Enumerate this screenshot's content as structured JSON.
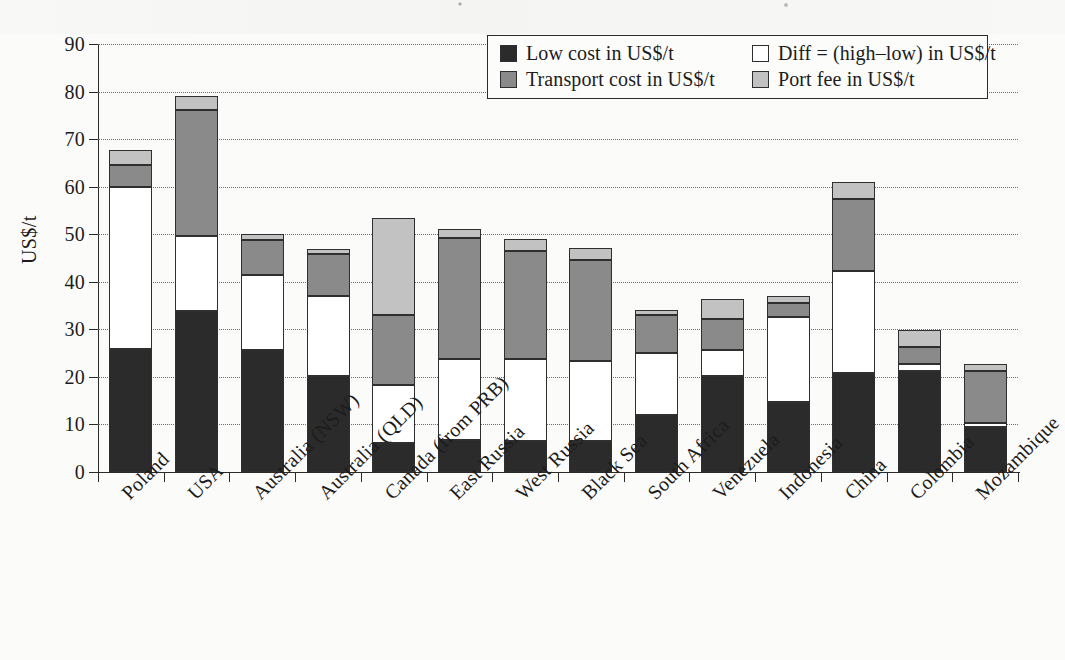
{
  "chart_data": {
    "type": "bar",
    "subtype": "stacked-vertical",
    "title": "",
    "xlabel": "",
    "ylabel": "US$/t",
    "ylim": [
      0,
      90
    ],
    "ytick_step": 10,
    "yticks": [
      0,
      10,
      20,
      30,
      40,
      50,
      60,
      70,
      80,
      90
    ],
    "ytick_labels": [
      "0",
      "10",
      "20",
      "30",
      "40",
      "50",
      "60",
      "70",
      "80",
      "90"
    ],
    "grid": "horizontal-dotted",
    "xtick_label_rotation": -45,
    "legend_position": "top-right-inside",
    "legend_columns": 2,
    "categories": [
      "Poland",
      "USA",
      "Australia (NSW)",
      "Australia (QLD)",
      "Canada (from PRB)",
      "East Russia",
      "West Russia",
      "Black Sea",
      "South Africa",
      "Venezuela",
      "Indonesia",
      "China",
      "Colombia",
      "Mozambique"
    ],
    "series": [
      {
        "name": "Low cost in US$/t",
        "color": "#2b2b2b",
        "values": [
          25.8,
          33.8,
          25.6,
          20.2,
          6.0,
          6.7,
          6.6,
          6.5,
          11.9,
          20.2,
          14.7,
          20.8,
          21.2,
          9.5
        ]
      },
      {
        "name": "Diff = (high–low) in US$/t",
        "color": "#ffffff",
        "values": [
          34.2,
          15.9,
          15.9,
          16.8,
          12.2,
          17.1,
          17.2,
          16.8,
          13.1,
          5.5,
          17.8,
          21.5,
          1.6,
          0.8
        ]
      },
      {
        "name": "Transport cost in US$/t",
        "color": "#8a8a8a",
        "values": [
          4.5,
          26.5,
          7.2,
          8.8,
          14.8,
          25.5,
          22.6,
          21.3,
          8.0,
          6.5,
          3.0,
          15.2,
          3.5,
          11.0
        ]
      },
      {
        "name": "Port fee in US$/t",
        "color": "#c2c2c2",
        "values": [
          3.3,
          2.8,
          1.3,
          1.2,
          20.5,
          1.7,
          2.6,
          2.6,
          1.0,
          4.1,
          1.5,
          3.5,
          3.5,
          1.4
        ]
      }
    ],
    "totals": [
      67.8,
      79.0,
      50.0,
      47.0,
      53.5,
      51.0,
      49.0,
      47.2,
      34.0,
      36.3,
      37.0,
      61.0,
      29.8,
      22.7
    ]
  },
  "legend": {
    "entries": [
      {
        "label": "Low cost in US$/t",
        "color": "#2b2b2b",
        "swatch": "filled-dark-square-icon"
      },
      {
        "label": "Diff = (high–low) in US$/t",
        "color": "#ffffff",
        "swatch": "empty-white-square-icon"
      },
      {
        "label": "Transport cost in US$/t",
        "color": "#8a8a8a",
        "swatch": "filled-mid-gray-square-icon"
      },
      {
        "label": "Port fee in US$/t",
        "color": "#c2c2c2",
        "swatch": "filled-light-gray-square-icon"
      }
    ]
  },
  "colors": {
    "low_cost": "#2b2b2b",
    "diff": "#ffffff",
    "transport": "#8a8a8a",
    "port_fee": "#c2c2c2",
    "axis": "#2a2a2a",
    "grid": "#6d6d6d",
    "page_background": "#fbfbfa"
  }
}
